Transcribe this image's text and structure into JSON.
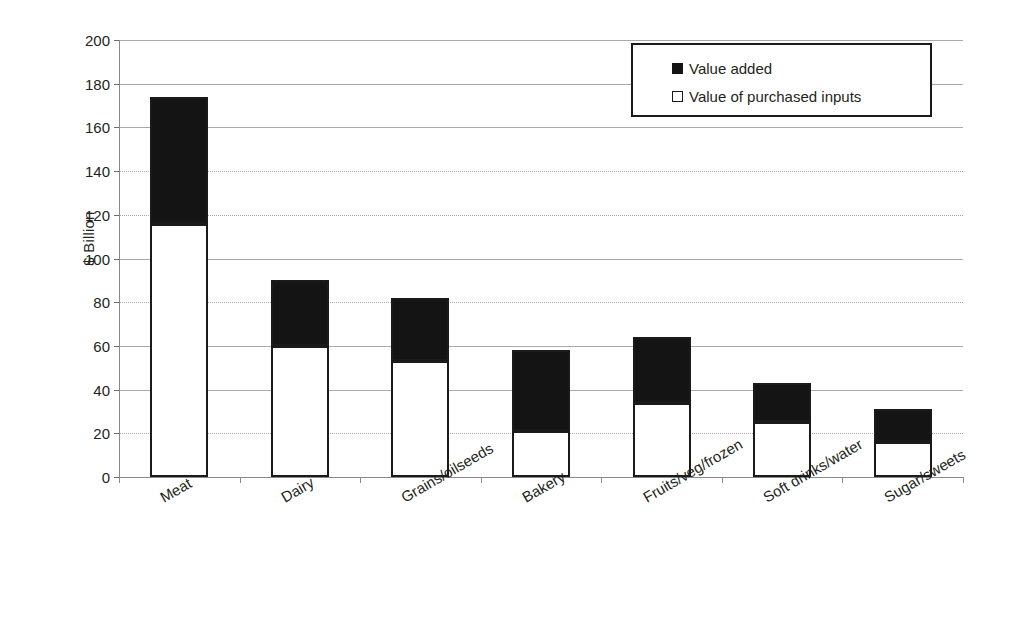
{
  "chart_data": {
    "type": "bar",
    "stacked": true,
    "title": "",
    "xlabel": "",
    "ylabel": "$ Billion",
    "ylim": [
      0,
      200
    ],
    "ytick_step": 20,
    "yticks": [
      0,
      20,
      40,
      60,
      80,
      100,
      120,
      140,
      160,
      180,
      200
    ],
    "ytick_labels": [
      "0",
      "20",
      "40",
      "60",
      "80",
      "100",
      "120",
      "140",
      "160",
      "180",
      "200"
    ],
    "grid": true,
    "legend_position": "top-right",
    "categories": [
      "Meat",
      "Dairy",
      "Grains/oilseeds",
      "Bakery",
      "Fruits/veg/frozen",
      "Soft drinks/water",
      "Sugar/sweets"
    ],
    "series": [
      {
        "name": "Value of purchased inputs",
        "color": "#ffffff",
        "values": [
          116,
          60,
          53,
          21,
          34,
          25,
          16
        ]
      },
      {
        "name": "Value added",
        "color": "#141414",
        "values": [
          58,
          30,
          29,
          37,
          30,
          18,
          15
        ]
      }
    ],
    "totals": [
      174,
      90,
      82,
      58,
      64,
      43,
      31
    ]
  },
  "legend": {
    "items": [
      {
        "label": "Value added",
        "marker": "filled-square"
      },
      {
        "label": "Value of purchased inputs",
        "marker": "hollow-square"
      }
    ]
  },
  "axis": {
    "y_title": "$ Billion"
  }
}
